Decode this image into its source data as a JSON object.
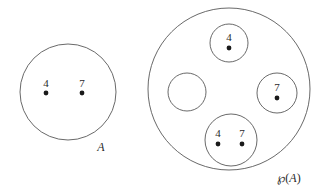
{
  "figure": {
    "background_color": "#ffffff",
    "stroke_color": "#585858",
    "text_color": "#2a2a2a",
    "dot_color": "#1a1a1a",
    "width": 329,
    "height": 193
  },
  "set_a": {
    "label": "A",
    "label_x": 101,
    "label_y": 151,
    "circle": {
      "cx": 68,
      "cy": 92,
      "r": 48
    },
    "elements": [
      {
        "value": "4",
        "label_x": 46,
        "label_y": 87,
        "dot_x": 46,
        "dot_y": 93,
        "dot_r": 2.4
      },
      {
        "value": "7",
        "label_x": 82,
        "label_y": 87,
        "dot_x": 82,
        "dot_y": 93,
        "dot_r": 2.4
      }
    ]
  },
  "power_set": {
    "label_prefix": "℘",
    "label_open": "(",
    "label_var": "A",
    "label_close": ")",
    "label_full": "℘(A)",
    "label_x": 289,
    "label_y": 182,
    "circle": {
      "cx": 229,
      "cy": 89,
      "r": 81
    },
    "subsets": [
      {
        "name": "singleton-4",
        "notation": "{4}",
        "circle": {
          "cx": 229,
          "cy": 43,
          "r": 19
        },
        "elements": [
          {
            "value": "4",
            "label_x": 229,
            "label_y": 41,
            "dot_x": 229,
            "dot_y": 48,
            "dot_r": 2.4
          }
        ]
      },
      {
        "name": "empty-set",
        "notation": "{ }",
        "circle": {
          "cx": 187,
          "cy": 92,
          "r": 19
        },
        "elements": []
      },
      {
        "name": "singleton-7",
        "notation": "{7}",
        "circle": {
          "cx": 277,
          "cy": 93,
          "r": 20
        },
        "elements": [
          {
            "value": "7",
            "label_x": 277,
            "label_y": 91,
            "dot_x": 277,
            "dot_y": 98,
            "dot_r": 2.4
          }
        ]
      },
      {
        "name": "pair-4-7",
        "notation": "{4,7}",
        "circle": {
          "cx": 231,
          "cy": 140,
          "r": 26
        },
        "elements": [
          {
            "value": "4",
            "label_x": 218,
            "label_y": 137,
            "dot_x": 218,
            "dot_y": 144,
            "dot_r": 2.4
          },
          {
            "value": "7",
            "label_x": 242,
            "label_y": 137,
            "dot_x": 242,
            "dot_y": 144,
            "dot_r": 2.4
          }
        ]
      }
    ]
  }
}
